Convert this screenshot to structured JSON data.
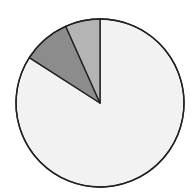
{
  "chart_data": {
    "type": "pie",
    "title": "",
    "start_angle_deg": 0,
    "direction": "clockwise",
    "slices": [
      {
        "label": "",
        "value": 84.1,
        "color": "#f2f2f2"
      },
      {
        "label": "",
        "value": 9.2,
        "color": "#8c8c8c"
      },
      {
        "label": "",
        "value": 6.7,
        "color": "#b4b4b4"
      }
    ],
    "legend": "none",
    "stroke_color": "#222222"
  },
  "header": {
    "title_fragment": ""
  }
}
